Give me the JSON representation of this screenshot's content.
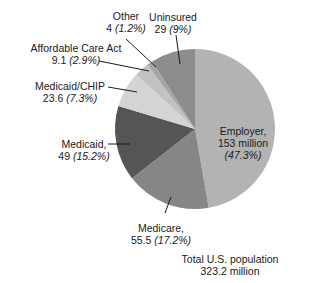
{
  "chart_data": {
    "type": "pie",
    "title": "",
    "center_label": [
      "Total U.S. population",
      "323.2 million"
    ],
    "total": 323.2,
    "unit": "million",
    "start_angle_deg": 0,
    "direction": "clockwise",
    "slices": [
      {
        "name": "Employer",
        "value": 153,
        "value_label": "153 million",
        "percent": 47.3,
        "percent_label": "(47.3%)",
        "color": "#b3b3b3"
      },
      {
        "name": "Medicare",
        "value": 55.5,
        "value_label": "55.5",
        "percent": 17.2,
        "percent_label": "(17.2%)",
        "color": "#868686"
      },
      {
        "name": "Medicaid",
        "value": 49,
        "value_label": "49",
        "percent": 15.2,
        "percent_label": "(15.2%)",
        "color": "#555555"
      },
      {
        "name": "Medicaid/CHIP",
        "value": 23.6,
        "value_label": "23.6",
        "percent": 7.3,
        "percent_label": "(7.3%)",
        "color": "#d4d4d4"
      },
      {
        "name": "Affordable Care Act",
        "value": 9.1,
        "value_label": "9.1",
        "percent": 2.9,
        "percent_label": "(2.9%)",
        "color": "#c2c2c2"
      },
      {
        "name": "Other",
        "value": 4,
        "value_label": "4",
        "percent": 1.2,
        "percent_label": "(1.2%)",
        "color": "#a6a6a6"
      },
      {
        "name": "Uninsured",
        "value": 29,
        "value_label": "29",
        "percent": 9,
        "percent_label": "(9%)",
        "color": "#8c8c8c"
      }
    ]
  },
  "labels": {
    "employer": {
      "line1": "Employer,",
      "line2": "153 million",
      "pct": "(47.3%)"
    },
    "medicare": {
      "name": "Medicare,",
      "value": "55.5",
      "pct": "(17.2%)"
    },
    "medicaid": {
      "name": "Medicaid,",
      "value": "49",
      "pct": "(15.2%)"
    },
    "chip": {
      "name": "Medicaid/CHIP",
      "value": "23.6",
      "pct": "(7.3%)"
    },
    "aca": {
      "name": "Affordable Care Act",
      "value": "9.1",
      "pct": "(2.9%)"
    },
    "other": {
      "name": "Other",
      "value": "4",
      "pct": "(1.2%)"
    },
    "uninsured": {
      "name": "Uninsured",
      "value": "29",
      "pct": "(9%)"
    },
    "total": {
      "line1": "Total U.S. population",
      "line2": "323.2 million"
    }
  }
}
